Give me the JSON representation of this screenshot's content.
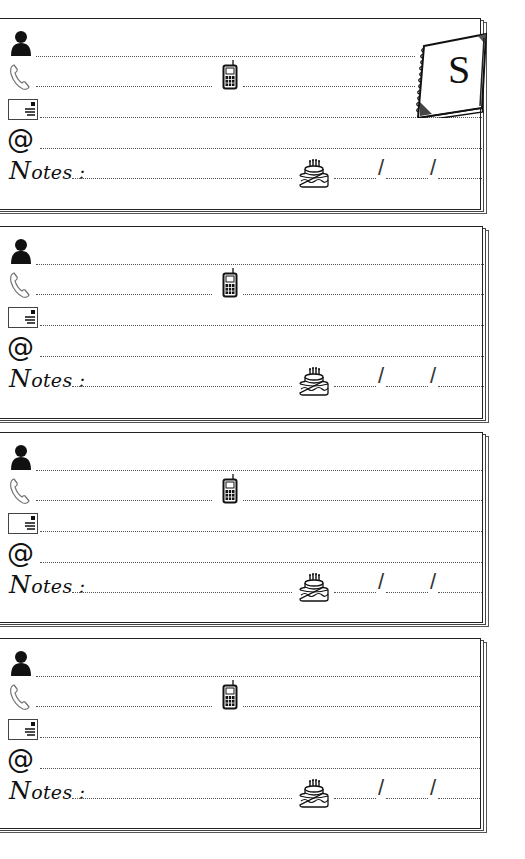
{
  "page": {
    "type": "address-book-page",
    "index_tab": {
      "letter": "S",
      "icon": "spiral-notebook-icon"
    }
  },
  "field_icons": {
    "name": "person-icon",
    "phone": "telephone-handset-icon",
    "mobile": "mobile-phone-icon",
    "address": "envelope-icon",
    "email": "at-sign-icon",
    "birthday": "birthday-cake-icon"
  },
  "labels": {
    "email_symbol": "@",
    "notes_label": "Notes :",
    "notes_initial": "N",
    "notes_rest": "otes :",
    "date_separator": "/"
  },
  "cards": [
    {
      "id": 1,
      "name": "",
      "phone": "",
      "mobile": "",
      "address": "",
      "email": "",
      "notes": "",
      "birthday": {
        "day": "",
        "month": "",
        "year": ""
      }
    },
    {
      "id": 2,
      "name": "",
      "phone": "",
      "mobile": "",
      "address": "",
      "email": "",
      "notes": "",
      "birthday": {
        "day": "",
        "month": "",
        "year": ""
      }
    },
    {
      "id": 3,
      "name": "",
      "phone": "",
      "mobile": "",
      "address": "",
      "email": "",
      "notes": "",
      "birthday": {
        "day": "",
        "month": "",
        "year": ""
      }
    },
    {
      "id": 4,
      "name": "",
      "phone": "",
      "mobile": "",
      "address": "",
      "email": "",
      "notes": "",
      "birthday": {
        "day": "",
        "month": "",
        "year": ""
      }
    }
  ],
  "colors": {
    "ink": "#111111",
    "frame": "#333333",
    "dotted_line": "#555555",
    "paper": "#ffffff"
  }
}
